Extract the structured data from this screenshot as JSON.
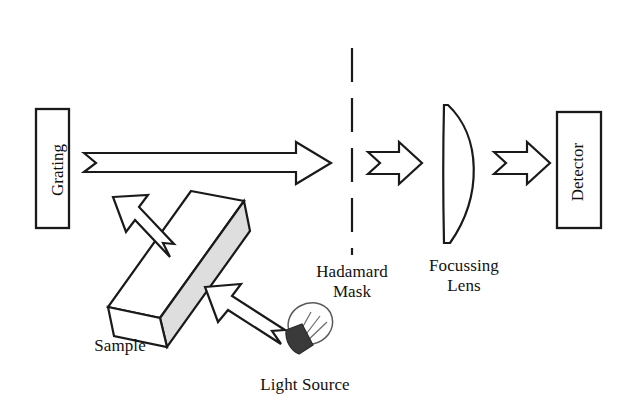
{
  "diagram": {
    "background_color": "#ffffff",
    "stroke_color": "#1a1a1a",
    "shade_color": "#dedede",
    "labels": {
      "grating": "Grating",
      "detector": "Detector",
      "hadamard_mask_line1": "Hadamard",
      "hadamard_mask_line2": "Mask",
      "focussing_lens_line1": "Focussing",
      "focussing_lens_line2": "Lens",
      "sample": "Sample",
      "light_source": "Light Source"
    },
    "components": [
      {
        "name": "grating",
        "type": "rectangle",
        "label": "Grating",
        "orientation": "vertical-text"
      },
      {
        "name": "sample",
        "type": "tilted-slab",
        "label": "Sample"
      },
      {
        "name": "light-source",
        "type": "bulb",
        "label": "Light Source"
      },
      {
        "name": "hadamard-mask",
        "type": "dashed-vertical-line",
        "label": "Hadamard Mask"
      },
      {
        "name": "focussing-lens",
        "type": "plano-convex-lens",
        "label": "Focussing Lens"
      },
      {
        "name": "detector",
        "type": "rectangle",
        "label": "Detector",
        "orientation": "vertical-text"
      }
    ],
    "beams": [
      {
        "name": "grating-to-mask-beam",
        "direction": "right",
        "style": "long-block-arrow"
      },
      {
        "name": "sample-to-grating-beam",
        "direction": "up-left",
        "style": "block-arrow"
      },
      {
        "name": "source-to-sample-beam",
        "direction": "up-left",
        "style": "block-arrow"
      },
      {
        "name": "mask-to-lens-beam",
        "direction": "right",
        "style": "short-block-arrow"
      },
      {
        "name": "lens-to-detector-beam",
        "direction": "right",
        "style": "short-block-arrow"
      }
    ]
  }
}
